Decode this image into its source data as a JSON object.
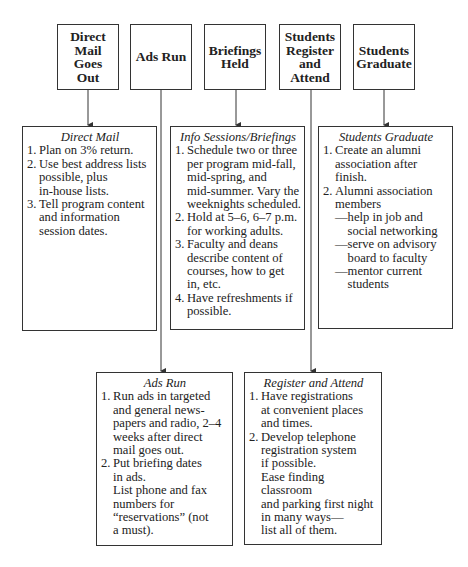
{
  "stages": [
    {
      "label": "Direct\nMail\nGoes\nOut"
    },
    {
      "label": "Ads Run"
    },
    {
      "label": "Briefings\nHeld"
    },
    {
      "label": "Students\nRegister\nand\nAttend"
    },
    {
      "label": "Students\nGraduate"
    }
  ],
  "details": {
    "direct_mail": {
      "title": "Direct Mail",
      "items": [
        {
          "num": "1.",
          "text": "Plan on 3% return."
        },
        {
          "num": "2.",
          "text": "Use best address lists\npossible, plus\nin-house lists."
        },
        {
          "num": "3.",
          "text": "Tell program content\nand information\nsession dates."
        }
      ]
    },
    "briefings": {
      "title": "Info Sessions/Briefings",
      "items": [
        {
          "num": "1.",
          "text": "Schedule two or three\nper program mid-fall,\nmid-spring, and\nmid-summer. Vary the\nweeknights scheduled."
        },
        {
          "num": "2.",
          "text": "Hold at 5–6, 6–7 p.m.\nfor working adults."
        },
        {
          "num": "3.",
          "text": "Faculty and deans\ndescribe content of\ncourses, how to get\nin, etc."
        },
        {
          "num": "4.",
          "text": "Have refreshments if\npossible."
        }
      ]
    },
    "graduate": {
      "title": "Students Graduate",
      "items": [
        {
          "num": "1.",
          "text": "Create an alumni\nassociation after finish."
        },
        {
          "num": "2.",
          "text": "Alumni association\nmembers"
        }
      ],
      "subitems": [
        {
          "dash": "—",
          "text": "help in job and\nsocial networking"
        },
        {
          "dash": "—",
          "text": "serve on advisory\nboard to faculty"
        },
        {
          "dash": "—",
          "text": "mentor current\nstudents"
        }
      ]
    },
    "ads_run": {
      "title": "Ads Run",
      "items": [
        {
          "num": "1.",
          "text": "Run ads in targeted\nand general news-\npapers and radio, 2–4\nweeks after direct\nmail goes out."
        },
        {
          "num": "2.",
          "text": "Put briefing dates\nin ads."
        }
      ],
      "note": "List phone and fax\nnumbers for\n“reservations” (not\na must)."
    },
    "register": {
      "title": "Register and Attend",
      "items": [
        {
          "num": "1.",
          "text": "Have registrations\nat convenient places\nand times."
        },
        {
          "num": "2.",
          "text": "Develop telephone\nregistration system\nif possible."
        }
      ],
      "note": "Ease finding classroom\nand parking first night\nin many ways—\nlist all of them."
    }
  },
  "colors": {
    "line": "#333333",
    "background": "#ffffff"
  }
}
